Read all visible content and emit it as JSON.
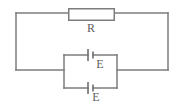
{
  "figure": {
    "background_color": "#ffffff",
    "line_color": "#7d7d7d",
    "text_color": "#5e5e5e",
    "width": 181,
    "height": 110
  },
  "components": {
    "resistor": {
      "label": "R",
      "type": "resistor",
      "shape": "rectangle",
      "x": 68,
      "y": 8,
      "width": 47,
      "height": 12,
      "label_x": 91,
      "label_y": 32
    },
    "cell_top": {
      "label": "E",
      "type": "battery-cell",
      "long_plate_x": 88,
      "short_plate_x": 93,
      "center_y": 55,
      "label_x": 100,
      "label_y": 68
    },
    "cell_bottom": {
      "label": "E",
      "type": "battery-cell",
      "long_plate_x": 88,
      "short_plate_x": 93,
      "center_y": 88,
      "label_x": 96,
      "label_y": 101
    }
  },
  "wires": {
    "outer_loop": {
      "left_x": 16,
      "right_x": 168,
      "top_y": 13,
      "bottom_y": 70
    },
    "inner_loop": {
      "left_x": 64,
      "right_x": 117,
      "top_y": 55,
      "bottom_y": 88
    }
  },
  "labels": {
    "resistor_label": "R",
    "cell_top_label": "E",
    "cell_bottom_label": "E"
  }
}
